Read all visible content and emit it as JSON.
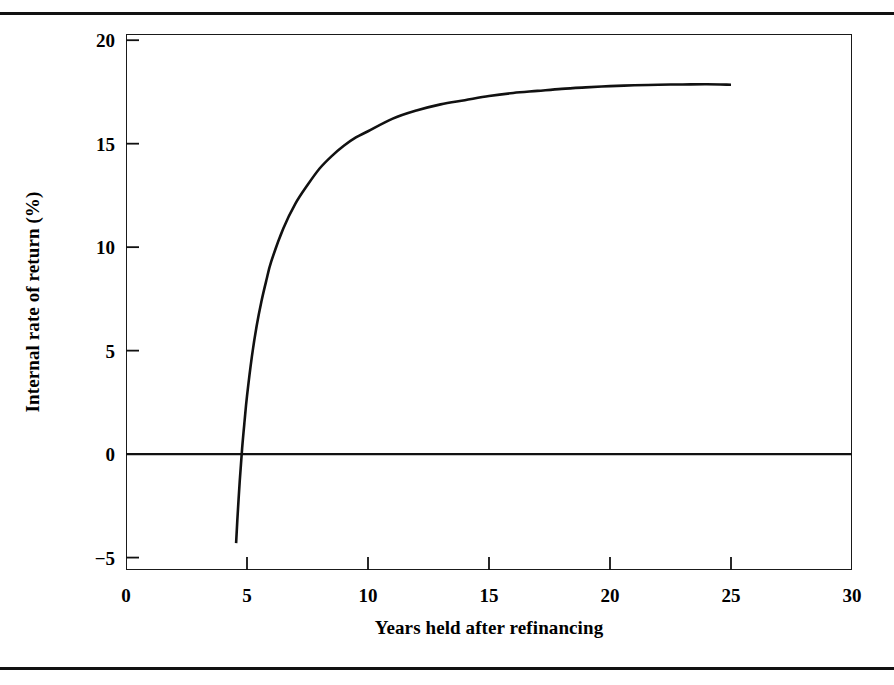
{
  "figure": {
    "clipped_title": "",
    "background_color": "#ffffff",
    "line_color": "#111111"
  },
  "chart_data": {
    "type": "line",
    "title": "",
    "xlabel": "Years held after refinancing",
    "ylabel": "Internal rate of return (%)",
    "xlim": [
      0,
      30
    ],
    "ylim": [
      -5.6,
      20.3
    ],
    "xticks": [
      0,
      5,
      10,
      15,
      20,
      25,
      30
    ],
    "xtick_labels": [
      "0",
      "5",
      "10",
      "15",
      "20",
      "25",
      "30"
    ],
    "yticks": [
      -5,
      0,
      5,
      10,
      15,
      20
    ],
    "ytick_labels": [
      "−5",
      "0",
      "5",
      "10",
      "15",
      "20"
    ],
    "grid": false,
    "legend": null,
    "zero_reference_line": 0,
    "series": [
      {
        "name": "Internal rate of return",
        "color": "#111111",
        "x": [
          4.55,
          4.6,
          4.7,
          4.8,
          4.9,
          5.0,
          5.2,
          5.4,
          5.6,
          5.8,
          6.0,
          6.5,
          7.0,
          7.5,
          8.0,
          8.5,
          9.0,
          9.5,
          10.0,
          11.0,
          12.0,
          13.0,
          14.0,
          15.0,
          16.0,
          17.0,
          18.0,
          19.0,
          20.0,
          21.0,
          22.0,
          23.0,
          24.0,
          25.0
        ],
        "y": [
          -4.3,
          -3.2,
          -1.3,
          0.3,
          1.6,
          2.8,
          4.7,
          6.2,
          7.4,
          8.4,
          9.3,
          10.9,
          12.1,
          13.0,
          13.8,
          14.4,
          14.9,
          15.3,
          15.6,
          16.2,
          16.6,
          16.9,
          17.1,
          17.3,
          17.45,
          17.55,
          17.65,
          17.72,
          17.78,
          17.82,
          17.85,
          17.86,
          17.87,
          17.85
        ]
      }
    ],
    "annotations": [
      {
        "text": "curve crosses zero at approximately 4.75 years",
        "visible": false
      }
    ]
  }
}
